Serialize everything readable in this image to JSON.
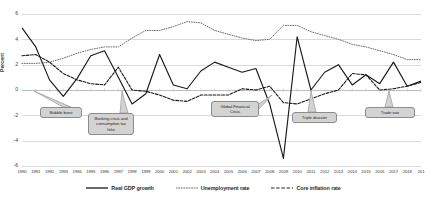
{
  "chart_data": {
    "type": "line",
    "title": "",
    "xlabel": "",
    "ylabel": "Percent",
    "ylim": [
      -6,
      6
    ],
    "yticks": [
      "6",
      "4",
      "2",
      "0",
      "-2",
      "-4",
      "-6"
    ],
    "grid": true,
    "legend_position": "bottom",
    "categories": [
      "1990",
      "1991",
      "1992",
      "1993",
      "1994",
      "1995",
      "1996",
      "1997",
      "1998",
      "1999",
      "2000",
      "2001",
      "2002",
      "2003",
      "2004",
      "2005",
      "2006",
      "2007",
      "2008",
      "2009",
      "2010",
      "2011",
      "2012",
      "2013",
      "2014",
      "2015",
      "2016",
      "2017",
      "2018",
      "201"
    ],
    "series": [
      {
        "name": "Real GDP growth",
        "style": "solid",
        "values": [
          4.9,
          3.4,
          0.8,
          -0.5,
          0.9,
          2.7,
          3.1,
          1.0,
          -1.1,
          -0.3,
          2.8,
          0.4,
          0.1,
          1.5,
          2.2,
          1.8,
          1.4,
          1.7,
          -1.1,
          -5.4,
          4.2,
          0.0,
          1.4,
          2.0,
          0.4,
          1.2,
          0.5,
          2.2,
          0.3,
          0.7
        ]
      },
      {
        "name": "Unemployment rate",
        "style": "dotted",
        "values": [
          2.1,
          2.1,
          2.2,
          2.5,
          2.9,
          3.2,
          3.4,
          3.4,
          4.1,
          4.7,
          4.7,
          5.0,
          5.4,
          5.3,
          4.7,
          4.4,
          4.1,
          3.9,
          4.0,
          5.1,
          5.1,
          4.6,
          4.3,
          4.0,
          3.6,
          3.4,
          3.1,
          2.8,
          2.4,
          2.4
        ]
      },
      {
        "name": "Core inflation rate",
        "style": "dashed",
        "values": [
          2.7,
          2.8,
          2.2,
          1.3,
          0.8,
          0.5,
          0.4,
          1.8,
          0.0,
          -0.1,
          -0.4,
          -0.8,
          -0.9,
          -0.4,
          -0.4,
          -0.4,
          0.1,
          0.0,
          0.3,
          -1.0,
          -1.1,
          -0.7,
          -0.3,
          0.0,
          1.3,
          1.2,
          0.0,
          0.1,
          0.3,
          0.6
        ]
      }
    ],
    "annotations": [
      {
        "label": "Bubble burst",
        "anchor_year": "1991"
      },
      {
        "label": "Banking crisis and consumption tax hike",
        "anchor_year": "1997"
      },
      {
        "label": "Global Financial Crisis",
        "anchor_year": "2008"
      },
      {
        "label": "Triple disaster",
        "anchor_year": "2011"
      },
      {
        "label": "Trade war",
        "anchor_year": "2018"
      }
    ]
  },
  "legend": {
    "items": [
      {
        "label": "Real GDP growth"
      },
      {
        "label": "Unemployment rate"
      },
      {
        "label": "Core inflation rate"
      }
    ]
  },
  "axis": {
    "y_title": "Percent"
  }
}
